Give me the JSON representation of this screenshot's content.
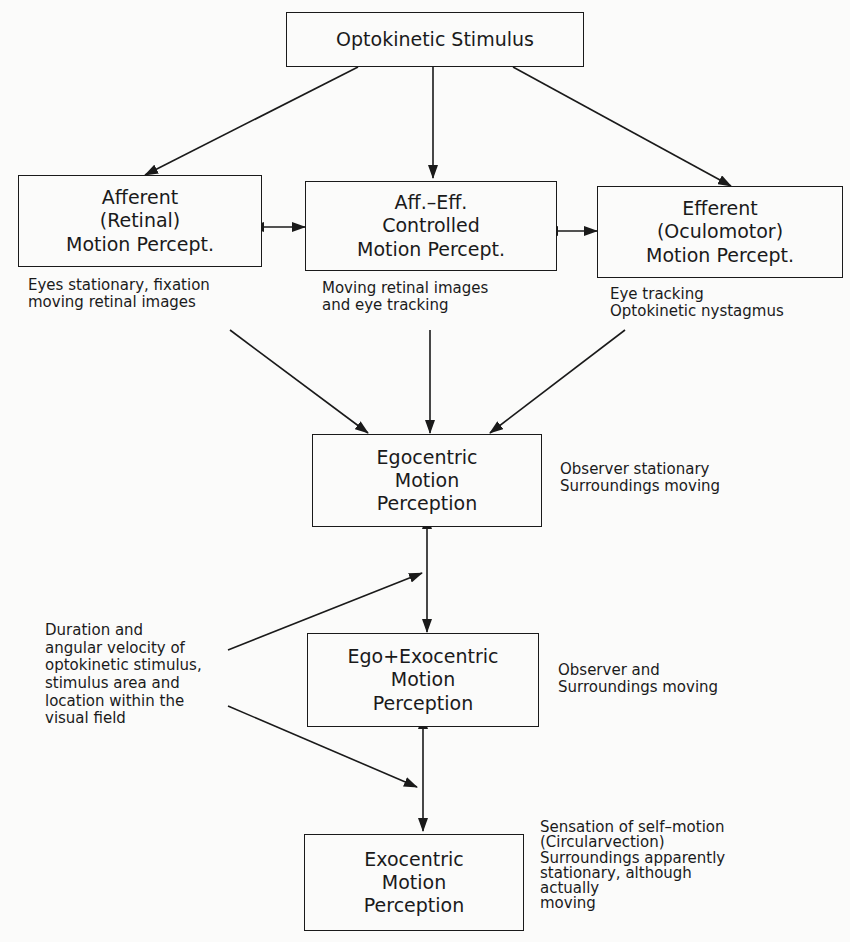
{
  "corner_mark": "[ ]",
  "boxes": {
    "stimulus": {
      "lines": [
        "Optokinetic Stimulus"
      ]
    },
    "afferent": {
      "lines": [
        "Afferent",
        "(Retinal)",
        "Motion  Percept."
      ]
    },
    "aff_eff": {
      "lines": [
        "Aff.–Eff.",
        "Controlled",
        "Motion  Percept."
      ]
    },
    "efferent": {
      "lines": [
        "Efferent",
        "(Oculomotor)",
        "Motion  Percept."
      ]
    },
    "egocentric": {
      "lines": [
        "Egocentric",
        "Motion",
        "Perception"
      ]
    },
    "ego_exo": {
      "lines": [
        "Ego+Exocentric",
        "Motion",
        "Perception"
      ]
    },
    "exocentric": {
      "lines": [
        "Exocentric",
        "Motion",
        "Perception"
      ]
    }
  },
  "notes": {
    "afferent": [
      "Eyes stationary, fixation",
      "moving retinal images"
    ],
    "aff_eff": [
      "Moving retinal images",
      "and eye tracking"
    ],
    "efferent": [
      "Eye tracking",
      "Optokinetic nystagmus"
    ],
    "egocentric": [
      "Observer stationary",
      "Surroundings moving"
    ],
    "ego_exo": [
      "Observer and",
      "Surroundings moving"
    ],
    "exocentric": [
      "Sensation of self–motion",
      "(Circularvection)",
      "Surroundings apparently",
      "stationary, although",
      "actually",
      "moving"
    ],
    "factors": [
      "Duration and",
      "angular velocity of",
      "optokinetic stimulus,",
      "stimulus area and",
      "location within the",
      "visual field"
    ]
  }
}
